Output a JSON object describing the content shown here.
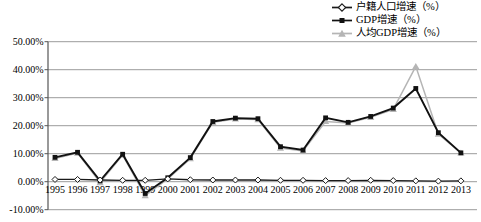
{
  "chart_data": {
    "type": "line",
    "title": "",
    "x": [
      "1995",
      "1996",
      "1997",
      "1998",
      "1999",
      "2000",
      "2001",
      "2002",
      "2003",
      "2004",
      "2005",
      "2006",
      "2007",
      "2008",
      "2009",
      "2010",
      "2011",
      "2012",
      "2013"
    ],
    "series": [
      {
        "name": "户籍人口增速（%）",
        "marker": "diamond-open",
        "color": "#1a1a1a",
        "values": [
          0.8,
          0.8,
          0.6,
          0.5,
          0.5,
          1.0,
          0.7,
          0.6,
          0.6,
          0.6,
          0.5,
          0.5,
          0.4,
          0.4,
          0.5,
          0.4,
          0.3,
          0.2,
          0.3
        ]
      },
      {
        "name": "GDP增速（%）",
        "marker": "square-filled",
        "color": "#111111",
        "values": [
          8.7,
          10.5,
          0.3,
          9.8,
          -4.2,
          1.4,
          8.6,
          21.5,
          22.7,
          22.5,
          12.5,
          11.3,
          22.8,
          21.2,
          23.3,
          26.3,
          33.3,
          17.5,
          10.3
        ]
      },
      {
        "name": "人均GDP增速（%）",
        "marker": "triangle-filled",
        "color": "#b5b5b5",
        "values": [
          8.3,
          10.2,
          -0.3,
          9.5,
          -5.0,
          1.0,
          8.2,
          21.2,
          22.4,
          22.2,
          12.0,
          11.0,
          21.5,
          21.0,
          23.0,
          25.8,
          41.2,
          17.0,
          10.3
        ]
      }
    ],
    "ylim": [
      -10,
      50
    ],
    "yticks": [
      {
        "value": 50,
        "label": "50.00%"
      },
      {
        "value": 40,
        "label": "40.00%"
      },
      {
        "value": 30,
        "label": "30.00%"
      },
      {
        "value": 20,
        "label": "20.00%"
      },
      {
        "value": 10,
        "label": "10.00%"
      },
      {
        "value": 0,
        "label": "0.00%"
      },
      {
        "value": -10,
        "label": "-10.00%"
      }
    ],
    "grid": true,
    "legend_position": "top-right",
    "colors": {
      "gridline": "#9c9c9c",
      "axis": "#555555",
      "text": "#000000",
      "background": "#ffffff"
    }
  }
}
